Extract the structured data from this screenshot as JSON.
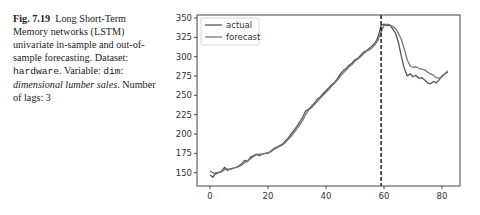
{
  "caption": {
    "fig_label": "Fig. 7.19",
    "text_1": "Long Short-Term Memory networks (LSTM) univariate in-sample and out-of-sample forecasting. Dataset: ",
    "dataset": "hardware",
    "text_2": ". Variable: ",
    "variable": "dim",
    "text_3": ": ",
    "variable_desc": "dimensional lumber sales",
    "text_4": ". Number of lags: 3"
  },
  "chart_data": {
    "type": "line",
    "title": "",
    "xlabel": "",
    "ylabel": "",
    "xlim": [
      -5,
      86
    ],
    "ylim": [
      133,
      352
    ],
    "xticks": [
      0,
      20,
      40,
      60,
      80
    ],
    "yticks": [
      150,
      175,
      200,
      225,
      250,
      275,
      300,
      325,
      350
    ],
    "grid": false,
    "legend_position": "upper left",
    "vline": {
      "x": 59,
      "style": "dashed",
      "color": "#111111"
    },
    "series": [
      {
        "name": "actual",
        "color": "#555555",
        "x": [
          0,
          1,
          2,
          3,
          4,
          5,
          6,
          7,
          8,
          9,
          10,
          11,
          12,
          13,
          14,
          15,
          16,
          17,
          18,
          19,
          20,
          21,
          22,
          23,
          24,
          25,
          26,
          27,
          28,
          29,
          30,
          31,
          32,
          33,
          34,
          35,
          36,
          37,
          38,
          39,
          40,
          41,
          42,
          43,
          44,
          45,
          46,
          47,
          48,
          49,
          50,
          51,
          52,
          53,
          54,
          55,
          56,
          57,
          58,
          59,
          60,
          61,
          62,
          63,
          64,
          65,
          66,
          67,
          68,
          69,
          70,
          71,
          72,
          73,
          74,
          75,
          76,
          77,
          78,
          79,
          80,
          81,
          82
        ],
        "values": [
          147,
          144,
          150,
          150,
          152,
          157,
          153,
          155,
          156,
          157,
          159,
          162,
          166,
          165,
          170,
          172,
          174,
          172,
          174,
          175,
          175,
          178,
          181,
          183,
          185,
          187,
          191,
          195,
          200,
          205,
          210,
          216,
          222,
          230,
          232,
          236,
          240,
          245,
          248,
          252,
          256,
          260,
          264,
          267,
          272,
          278,
          282,
          285,
          289,
          292,
          296,
          298,
          302,
          306,
          308,
          311,
          314,
          318,
          326,
          340,
          342,
          340,
          341,
          336,
          330,
          318,
          300,
          285,
          275,
          278,
          274,
          276,
          272,
          273,
          270,
          266,
          265,
          268,
          266,
          270,
          275,
          278,
          280
        ]
      },
      {
        "name": "forecast",
        "color": "#777777",
        "x": [
          0,
          1,
          2,
          3,
          4,
          5,
          6,
          7,
          8,
          9,
          10,
          11,
          12,
          13,
          14,
          15,
          16,
          17,
          18,
          19,
          20,
          21,
          22,
          23,
          24,
          25,
          26,
          27,
          28,
          29,
          30,
          31,
          32,
          33,
          34,
          35,
          36,
          37,
          38,
          39,
          40,
          41,
          42,
          43,
          44,
          45,
          46,
          47,
          48,
          49,
          50,
          51,
          52,
          53,
          54,
          55,
          56,
          57,
          58,
          59,
          60,
          61,
          62,
          63,
          64,
          65,
          66,
          67,
          68,
          69,
          70,
          71,
          72,
          73,
          74,
          75,
          76,
          77,
          78,
          79,
          80,
          81,
          82
        ],
        "values": [
          152,
          150,
          148,
          150,
          151,
          154,
          155,
          154,
          156,
          157,
          158,
          160,
          163,
          165,
          168,
          171,
          173,
          174,
          174,
          175,
          176,
          177,
          180,
          182,
          184,
          186,
          189,
          193,
          197,
          202,
          207,
          212,
          218,
          225,
          231,
          234,
          238,
          242,
          246,
          250,
          254,
          258,
          262,
          266,
          270,
          275,
          279,
          283,
          287,
          290,
          294,
          297,
          300,
          304,
          307,
          309,
          312,
          316,
          322,
          332,
          340,
          342,
          341,
          339,
          336,
          330,
          322,
          310,
          296,
          288,
          286,
          287,
          285,
          284,
          283,
          280,
          278,
          276,
          273,
          272,
          274,
          278,
          282
        ]
      }
    ]
  },
  "legend": [
    {
      "label": "actual",
      "color": "#555555"
    },
    {
      "label": "forecast",
      "color": "#777777"
    }
  ]
}
